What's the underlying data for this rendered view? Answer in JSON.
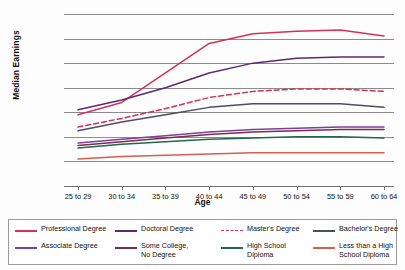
{
  "chart_data": {
    "type": "line",
    "title": "",
    "xlabel": "Age",
    "ylabel": "Median Earnings",
    "categories": [
      "25 to 29",
      "30 to 34",
      "35 to 39",
      "40 to 44",
      "45 to 49",
      "50 to 54",
      "55 to 59",
      "60 to 64"
    ],
    "ylim": [
      0,
      140000
    ],
    "ytick_labels": [
      "$140,000",
      "$120,000",
      "$100,000",
      "$80,000",
      "$60,000",
      "$40,000",
      "$20,000",
      "$0"
    ],
    "ytick_values": [
      140000,
      120000,
      100000,
      80000,
      60000,
      40000,
      20000,
      0
    ],
    "grid": "horizontal",
    "legend_position": "bottom",
    "series": [
      {
        "name": "Professional Degree",
        "color": "#d6315a",
        "style": "solid",
        "values": [
          58000,
          68000,
          92000,
          116000,
          124000,
          126000,
          127000,
          122000
        ]
      },
      {
        "name": "Doctoral Degree",
        "color": "#5d2a6b",
        "style": "solid",
        "values": [
          62000,
          70000,
          80000,
          92000,
          100000,
          104000,
          105000,
          105000
        ]
      },
      {
        "name": "Master's Degree",
        "color": "#cf3358",
        "style": "dashed",
        "values": [
          48000,
          55000,
          63000,
          72000,
          77000,
          79000,
          79000,
          77000
        ]
      },
      {
        "name": "Bachelor's Degree",
        "color": "#4b4f5e",
        "style": "solid",
        "values": [
          45000,
          52000,
          58000,
          64000,
          67000,
          67000,
          67000,
          64000
        ]
      },
      {
        "name": "Associate Degree",
        "color": "#7b3f9e",
        "style": "solid",
        "values": [
          35000,
          38000,
          41000,
          44000,
          46000,
          47000,
          48000,
          48000
        ]
      },
      {
        "name": "Some College,\nNo Degree",
        "color": "#7a2f47",
        "style": "solid",
        "values": [
          33000,
          36000,
          39000,
          42000,
          44000,
          45000,
          46000,
          46000
        ]
      },
      {
        "name": "High School\nDiploma",
        "color": "#1f6a4d",
        "style": "solid",
        "values": [
          31000,
          34000,
          36000,
          38000,
          39000,
          40000,
          40000,
          39000
        ]
      },
      {
        "name": "Less than a High\nSchool Diploma",
        "color": "#d4604f",
        "style": "solid",
        "values": [
          22000,
          24000,
          25000,
          26000,
          27000,
          27000,
          27000,
          27000
        ]
      }
    ]
  },
  "legend": {
    "items": [
      {
        "label": "Professional Degree",
        "color": "#d6315a",
        "style": "solid"
      },
      {
        "label": "Doctoral Degree",
        "color": "#5d2a6b",
        "style": "solid"
      },
      {
        "label": "Master's Degree",
        "color": "#cf3358",
        "style": "dashed"
      },
      {
        "label": "Bachelor's Degree",
        "color": "#4b4f5e",
        "style": "solid"
      },
      {
        "label": "Associate Degree",
        "color": "#7b3f9e",
        "style": "solid"
      },
      {
        "label": "Some College,\nNo Degree",
        "color": "#7a2f47",
        "style": "solid"
      },
      {
        "label": "High School\nDiploma",
        "color": "#1f6a4d",
        "style": "solid"
      },
      {
        "label": "Less than a High\nSchool Diploma",
        "color": "#d4604f",
        "style": "solid"
      }
    ]
  }
}
